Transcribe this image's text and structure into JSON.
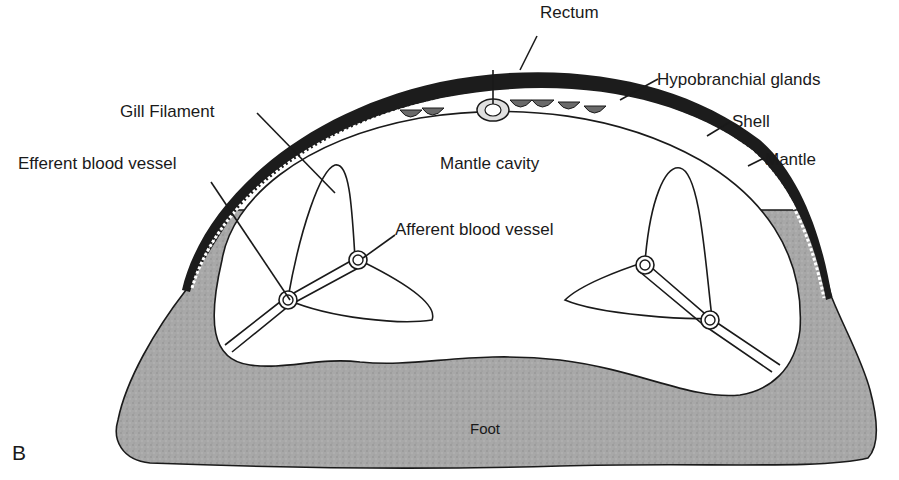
{
  "figure": {
    "panel_letter": "B",
    "colors": {
      "background": "#ffffff",
      "foot_fill": "#a9a9a9",
      "shell_fill": "#1c1c1c",
      "mantle_dots": "#ffffff",
      "outline": "#1a1a1a"
    }
  },
  "labels": {
    "rectum": "Rectum",
    "hypobranchial_glands": "Hypobranchial glands",
    "shell": "Shell",
    "mantle": "Mantle",
    "gill_filament": "Gill Filament",
    "mantle_cavity": "Mantle cavity",
    "efferent_blood_vessel": "Efferent blood vessel",
    "afferent_blood_vessel": "Afferent blood vessel",
    "foot": "Foot"
  }
}
